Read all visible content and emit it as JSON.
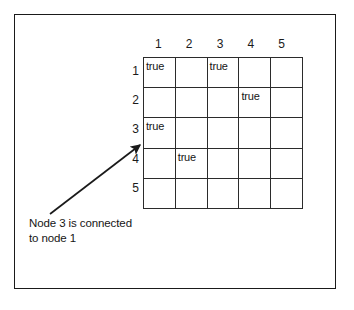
{
  "figure": {
    "background_color": "#ffffff",
    "line_color": "#1a1a1a",
    "text_color": "#151515"
  },
  "matrix": {
    "column_headers": [
      "1",
      "2",
      "3",
      "4",
      "5"
    ],
    "row_headers": [
      "1",
      "2",
      "3",
      "4",
      "5"
    ],
    "rows": [
      [
        "true",
        "",
        "true",
        "",
        ""
      ],
      [
        "",
        "",
        "",
        "true",
        ""
      ],
      [
        "true",
        "",
        "",
        "",
        ""
      ],
      [
        "",
        "true",
        "",
        "",
        ""
      ],
      [
        "",
        "",
        "",
        "",
        ""
      ]
    ]
  },
  "annotation": {
    "caption_line_1": "Node 3 is connected",
    "caption_line_2": "to node 1",
    "arrow_name": "arrow-to-cell-row3-col1"
  }
}
